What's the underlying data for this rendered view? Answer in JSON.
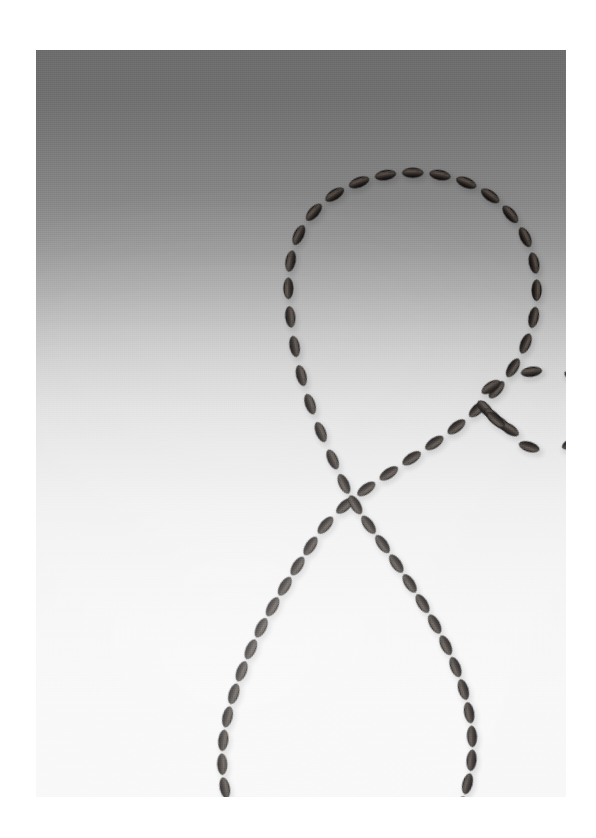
{
  "page": {
    "background_color": "#ffffff",
    "width": 596,
    "height": 838
  },
  "photograph": {
    "frame": {
      "left": 36,
      "top": 50,
      "width": 530,
      "height": 747
    },
    "backdrop": {
      "type": "vertical-gradient-sweep",
      "top_color": "#6d6d6d",
      "mid_color": "#c4c4c4",
      "bottom_color": "#f8f8f8"
    },
    "subject_label": "beaded-necklace",
    "subject_description": "Single strand of dark elongated ridged beads laid out in a figure-eight with a small secondary loop at right",
    "bead_color": "#231f1e",
    "bead_highlight_color": "#6a6058",
    "bead_shadow_color": "#0d0b0b",
    "drop_shadow_color": "rgba(60,60,60,0.32)",
    "bead_count_total": 84,
    "bead_length_px": 24,
    "bead_width_px": 11
  },
  "geometry": {
    "upper_loop": {
      "name": "upper-loop",
      "bead_count": 27,
      "path": "M 253 252 C 250 214, 258 183, 280 160 C 305 134, 345 121, 385 123 C 428 125, 463 145, 483 176 C 502 206, 505 243, 495 278 C 486 309, 468 334, 446 355 C 424 376, 400 392, 376 408 C 352 424, 330 438, 312 453 C 298 465, 288 476, 281 486"
    },
    "crossing_upper_left": {
      "name": "crossing-strand-upper-left",
      "bead_count": 6,
      "path": "M 253 252 C 255 285, 262 318, 272 348 C 281 375, 292 400, 303 423"
    },
    "lower_loop": {
      "name": "lower-loop",
      "bead_count": 40,
      "path": "M 281 486 C 268 506, 252 530, 237 556 C 217 591, 200 629, 191 669 C 181 712, 186 752, 208 783 C 231 816, 271 833, 312 831 C 354 829, 392 808, 414 774 C 436 740, 441 698, 432 657 C 423 617, 404 581, 383 548 C 366 521, 348 496, 332 474 C 321 458, 312 444, 303 423"
    },
    "right_tail": {
      "name": "right-tail-to-small-loop",
      "bead_count": 4,
      "path": "M 446 355 C 455 366, 466 375, 478 382"
    },
    "small_loop": {
      "name": "small-side-loop",
      "bead_count": 7,
      "path": "M 478 382 C 466 376, 455 366, 446 356 C 443 352, 443 346, 448 342 C 463 330, 483 322, 504 321 C 526 320, 546 327, 556 341 C 566 355, 563 373, 549 385 C 535 397, 513 402, 494 397 C 486 395, 481 389, 478 382 Z"
    }
  },
  "metrics": {
    "image_type": "Natural-Image",
    "orientation": "portrait",
    "subject": "necklace"
  }
}
